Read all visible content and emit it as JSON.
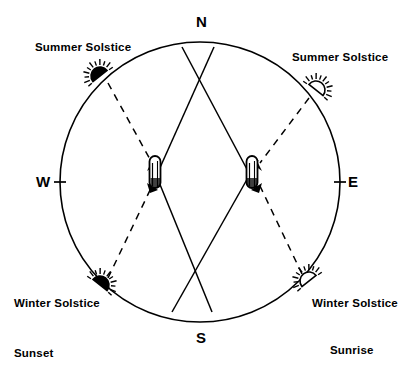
{
  "diagram": {
    "stroke_color": "#000000",
    "background_color": "#ffffff",
    "horizon": {
      "center_x": 200,
      "center_y": 182,
      "radius": 140
    },
    "cardinals": [
      {
        "id": "north",
        "label": "N",
        "x": 196,
        "y": 14,
        "tick": false
      },
      {
        "id": "east",
        "label": "E",
        "x": 348,
        "y": 174,
        "tick": true
      },
      {
        "id": "south",
        "label": "S",
        "x": 196,
        "y": 330,
        "tick": false
      },
      {
        "id": "west",
        "label": "W",
        "x": 36,
        "y": 174,
        "tick": true
      }
    ],
    "suns": [
      {
        "id": "summer-solstice-sunset",
        "style": "filled",
        "cx": 100,
        "cy": 76,
        "r": 9,
        "rotation": -38,
        "label": "Summer Solstice",
        "label_x": 35,
        "label_y": 42,
        "event": "Sunset"
      },
      {
        "id": "summer-solstice-sunrise",
        "style": "outline",
        "cx": 316,
        "cy": 90,
        "r": 9,
        "rotation": 38,
        "label": "Summer Solstice",
        "label_x": 292,
        "label_y": 52,
        "event": "Sunrise"
      },
      {
        "id": "winter-solstice-sunset",
        "style": "filled",
        "cx": 100,
        "cy": 285,
        "r": 9,
        "rotation": 38,
        "label": "Winter Solstice",
        "label_x": 14,
        "label_y": 298,
        "event": "Sunset"
      },
      {
        "id": "winter-solstice-sunrise",
        "style": "outline",
        "cx": 309,
        "cy": 281,
        "r": 9,
        "rotation": -38,
        "label": "Winter Solstice",
        "label_x": 312,
        "label_y": 298,
        "event": "Sunrise"
      }
    ],
    "events": [
      {
        "id": "sunset-label",
        "label": "Sunset",
        "x": 14,
        "y": 348
      },
      {
        "id": "sunrise-label",
        "label": "Sunrise",
        "x": 330,
        "y": 345
      }
    ],
    "stones": [
      {
        "id": "stone-west",
        "x": 155,
        "y": 172,
        "width": 11,
        "height": 32
      },
      {
        "id": "stone-east",
        "x": 252,
        "y": 172,
        "width": 11,
        "height": 32
      }
    ],
    "sightlines_solid": [
      {
        "id": "sightline-west-stone-to-ne",
        "x1": 150,
        "y1": 190,
        "x2": 214,
        "y2": 47
      },
      {
        "id": "sightline-east-stone-to-nw",
        "x1": 258,
        "y1": 190,
        "x2": 182,
        "y2": 47
      },
      {
        "id": "sightline-west-stone-to-se",
        "x1": 150,
        "y1": 160,
        "x2": 212,
        "y2": 312
      },
      {
        "id": "sightline-east-stone-to-sw",
        "x1": 258,
        "y1": 160,
        "x2": 172,
        "y2": 312
      }
    ],
    "sightlines_dashed": [
      {
        "id": "alignment-summer-sunset-to-stone",
        "x1": 108,
        "y1": 83,
        "x2": 152,
        "y2": 163
      },
      {
        "id": "alignment-summer-sunrise-to-stone",
        "x1": 309,
        "y1": 98,
        "x2": 260,
        "y2": 163
      },
      {
        "id": "alignment-winter-sunset-to-stone",
        "x1": 108,
        "y1": 278,
        "x2": 152,
        "y2": 186
      },
      {
        "id": "alignment-winter-sunrise-to-stone",
        "x1": 302,
        "y1": 274,
        "x2": 260,
        "y2": 186
      }
    ]
  }
}
